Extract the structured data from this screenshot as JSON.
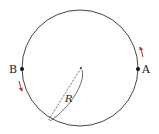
{
  "diagram": {
    "type": "circle-motion",
    "circle": {
      "cx": 80,
      "cy": 68,
      "r": 58,
      "stroke": "#444444"
    },
    "center_point": {
      "x": 81,
      "y": 68
    },
    "points": [
      {
        "id": "A",
        "label": "A",
        "x": 138,
        "y": 69
      },
      {
        "id": "B",
        "label": "B",
        "x": 22,
        "y": 69
      }
    ],
    "radius": {
      "label": "R",
      "from": {
        "x": 81,
        "y": 68
      },
      "to": {
        "x": 48,
        "y": 121
      }
    },
    "arrows": [
      {
        "near": "A",
        "direction": "up",
        "color": "#b03030"
      },
      {
        "near": "B",
        "direction": "down",
        "color": "#b03030"
      }
    ]
  }
}
